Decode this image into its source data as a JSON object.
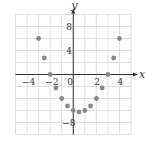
{
  "chart_data": {
    "type": "scatter",
    "title": "",
    "xlabel": "x",
    "ylabel": "y",
    "xlim": [
      -5,
      5
    ],
    "ylim": [
      -10,
      10
    ],
    "grid": true,
    "grid_x_step": 1,
    "grid_y_step": 2,
    "legend": null,
    "x_tick_labels": [
      "-4",
      "-2",
      "0",
      "2",
      "4"
    ],
    "x_ticks": [
      -4,
      -2,
      0,
      2,
      4
    ],
    "y_tick_labels": [
      "8",
      "4",
      "-8"
    ],
    "y_ticks": [
      8,
      4,
      -8
    ],
    "series": [
      {
        "name": "points",
        "color": "#888888",
        "x": [
          -3,
          -2.5,
          -2,
          -1.5,
          -1,
          -0.5,
          0,
          0.5,
          1,
          1.5,
          2,
          2.5,
          3,
          3.5,
          4
        ],
        "y": [
          6,
          2.75,
          0,
          -2.25,
          -4,
          -5.25,
          -6,
          -6.25,
          -6,
          -5.25,
          -4,
          -2.25,
          0,
          2.75,
          6
        ]
      }
    ]
  },
  "colors": {
    "grid": "#d8d8d8",
    "axis": "#333333",
    "point": "#888888"
  }
}
